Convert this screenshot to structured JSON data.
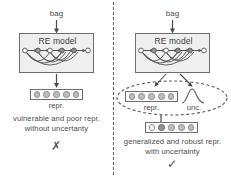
{
  "figure": {
    "width": 231,
    "height": 177,
    "divider": "vertical-dashed-separator"
  },
  "colors": {
    "box_fill": "#efefef",
    "box_stroke": "#6e6e6e",
    "node_fill": "#bdbdbd",
    "node_dark": "#909090",
    "node_hollow": "#ffffff",
    "text": "#4a4a4a",
    "dashed": "#5c5c5c"
  },
  "panels": {
    "left": {
      "input_label": "bag",
      "model_label": "RE model",
      "repr_label": "repr.",
      "repr_cells": [
        "gray",
        "gray",
        "gray",
        "gray",
        "gray"
      ],
      "caption_line1": "vulnerable and poor repr.",
      "caption_line2": "without uncertanty",
      "verdict": "✗",
      "verdict_name": "cross-mark"
    },
    "right": {
      "input_label": "bag",
      "model_label": "RE model",
      "repr_label": "repr.",
      "repr_cells": [
        "gray",
        "gray",
        "gray",
        "gray",
        "gray"
      ],
      "uncertainty_label": "unc.",
      "uncertainty_shape": "gaussian-curve",
      "output_cells": [
        "hollow",
        "dark",
        "gray",
        "gray",
        "gray"
      ],
      "caption_line1": "generalized and robust repr.",
      "caption_line2": "with uncertainty",
      "verdict": "✓",
      "verdict_name": "check-mark"
    }
  }
}
